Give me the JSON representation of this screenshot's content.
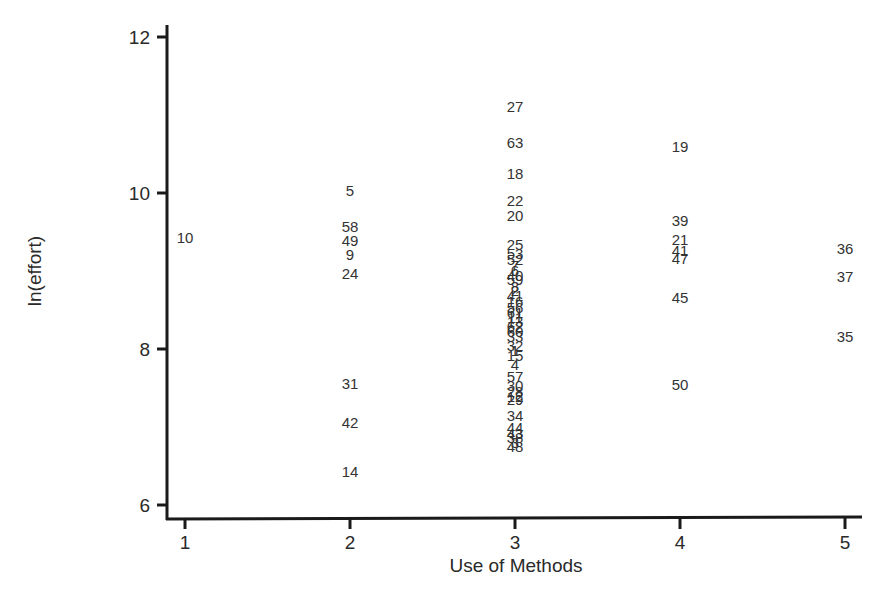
{
  "chart_data": {
    "type": "scatter",
    "title": "",
    "xlabel": "Use of Methods",
    "ylabel": "ln(effort)",
    "xlim": [
      0.98,
      5.2
    ],
    "ylim": [
      5.8,
      12.2
    ],
    "xticks": [
      1,
      2,
      3,
      4,
      5
    ],
    "yticks": [
      6,
      8,
      10,
      12
    ],
    "grid": false,
    "legend": null,
    "marker": "text labels (project IDs)",
    "points": [
      {
        "label": "10",
        "x": 1,
        "y": 9.42
      },
      {
        "label": "5",
        "x": 2,
        "y": 10.02
      },
      {
        "label": "58",
        "x": 2,
        "y": 9.57
      },
      {
        "label": "49",
        "x": 2,
        "y": 9.38
      },
      {
        "label": "9",
        "x": 2,
        "y": 9.2
      },
      {
        "label": "24",
        "x": 2,
        "y": 8.96
      },
      {
        "label": "31",
        "x": 2,
        "y": 7.55
      },
      {
        "label": "42",
        "x": 2,
        "y": 7.05
      },
      {
        "label": "14",
        "x": 2,
        "y": 6.42
      },
      {
        "label": "27",
        "x": 3,
        "y": 11.1
      },
      {
        "label": "63",
        "x": 3,
        "y": 10.64
      },
      {
        "label": "18",
        "x": 3,
        "y": 10.24
      },
      {
        "label": "22",
        "x": 3,
        "y": 9.9
      },
      {
        "label": "20",
        "x": 3,
        "y": 9.7
      },
      {
        "label": "25",
        "x": 3,
        "y": 9.33
      },
      {
        "label": "53",
        "x": 3,
        "y": 9.22
      },
      {
        "label": "52",
        "x": 3,
        "y": 9.14
      },
      {
        "label": "7",
        "x": 3,
        "y": 9.06
      },
      {
        "label": "6",
        "x": 3,
        "y": 9.0
      },
      {
        "label": "40",
        "x": 3,
        "y": 8.94
      },
      {
        "label": "59",
        "x": 3,
        "y": 8.88
      },
      {
        "label": "8",
        "x": 3,
        "y": 8.8
      },
      {
        "label": "2",
        "x": 3,
        "y": 8.74
      },
      {
        "label": "41",
        "x": 3,
        "y": 8.68
      },
      {
        "label": "16",
        "x": 3,
        "y": 8.6
      },
      {
        "label": "56",
        "x": 3,
        "y": 8.52
      },
      {
        "label": "61",
        "x": 3,
        "y": 8.46
      },
      {
        "label": "11",
        "x": 3,
        "y": 8.4
      },
      {
        "label": "13",
        "x": 3,
        "y": 8.34
      },
      {
        "label": "62",
        "x": 3,
        "y": 8.28
      },
      {
        "label": "60",
        "x": 3,
        "y": 8.22
      },
      {
        "label": "33",
        "x": 3,
        "y": 8.16
      },
      {
        "label": "32",
        "x": 3,
        "y": 8.04
      },
      {
        "label": "1",
        "x": 3,
        "y": 7.97
      },
      {
        "label": "15",
        "x": 3,
        "y": 7.91
      },
      {
        "label": "4",
        "x": 3,
        "y": 7.8
      },
      {
        "label": "57",
        "x": 3,
        "y": 7.64
      },
      {
        "label": "30",
        "x": 3,
        "y": 7.53
      },
      {
        "label": "28",
        "x": 3,
        "y": 7.45
      },
      {
        "label": "12",
        "x": 3,
        "y": 7.39
      },
      {
        "label": "29",
        "x": 3,
        "y": 7.34
      },
      {
        "label": "34",
        "x": 3,
        "y": 7.14
      },
      {
        "label": "44",
        "x": 3,
        "y": 6.99
      },
      {
        "label": "43",
        "x": 3,
        "y": 6.91
      },
      {
        "label": "38",
        "x": 3,
        "y": 6.86
      },
      {
        "label": "3",
        "x": 3,
        "y": 6.8
      },
      {
        "label": "48",
        "x": 3,
        "y": 6.74
      },
      {
        "label": "19",
        "x": 4,
        "y": 10.59
      },
      {
        "label": "39",
        "x": 4,
        "y": 9.64
      },
      {
        "label": "21",
        "x": 4,
        "y": 9.4
      },
      {
        "label": "41b",
        "x": 4,
        "y": 9.26
      },
      {
        "label": "47",
        "x": 4,
        "y": 9.15
      },
      {
        "label": "45",
        "x": 4,
        "y": 8.66
      },
      {
        "label": "50",
        "x": 4,
        "y": 7.54
      },
      {
        "label": "36",
        "x": 5,
        "y": 9.28
      },
      {
        "label": "37",
        "x": 5,
        "y": 8.92
      },
      {
        "label": "35",
        "x": 5,
        "y": 8.16
      }
    ]
  }
}
